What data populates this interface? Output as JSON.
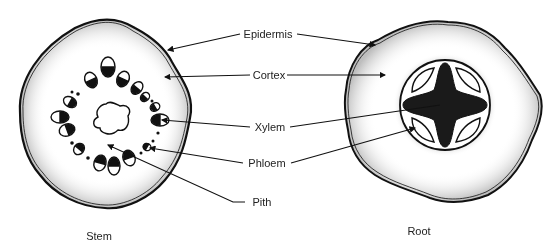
{
  "diagram": {
    "labels": {
      "epidermis": "Epidermis",
      "cortex": "Cortex",
      "xylem": "Xylem",
      "phloem": "Phloem",
      "pith": "Pith"
    },
    "captions": {
      "stem": "Stem",
      "root": "Root"
    }
  }
}
